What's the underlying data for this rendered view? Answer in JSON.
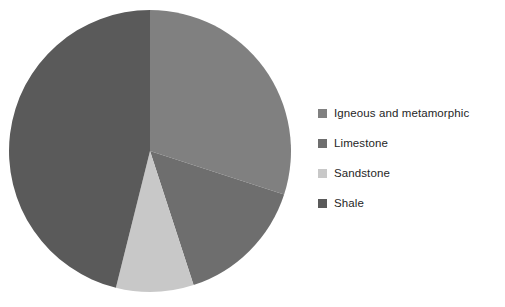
{
  "chart_data": {
    "type": "pie",
    "title": "",
    "categories": [
      "Igneous and metamorphic",
      "Limestone",
      "Sandstone",
      "Shale"
    ],
    "values": [
      30,
      15,
      9,
      46
    ],
    "unit": "percent",
    "colors": [
      "#808080",
      "#6e6e6e",
      "#c8c8c8",
      "#5a5a5a"
    ],
    "start_angle_deg": 0,
    "direction": "clockwise",
    "legend_position": "right",
    "grid": false,
    "labels_on_slices": false,
    "slice_angles_deg": [
      {
        "name": "Igneous and metamorphic",
        "start": 0,
        "end": 108
      },
      {
        "name": "Limestone",
        "start": 108,
        "end": 162
      },
      {
        "name": "Sandstone",
        "start": 162,
        "end": 194
      },
      {
        "name": "Shale",
        "start": 194,
        "end": 360
      }
    ]
  },
  "legend": {
    "items": [
      {
        "label": "Igneous and metamorphic",
        "color": "#808080",
        "swatch_icon": "square-swatch-icon"
      },
      {
        "label": "Limestone",
        "color": "#6e6e6e",
        "swatch_icon": "square-swatch-icon"
      },
      {
        "label": "Sandstone",
        "color": "#c8c8c8",
        "swatch_icon": "square-swatch-icon"
      },
      {
        "label": "Shale",
        "color": "#5a5a5a",
        "swatch_icon": "square-swatch-icon"
      }
    ]
  },
  "pie_geometry": {
    "center_x": 150,
    "center_y": 151,
    "radius": 141
  },
  "canvas": {
    "width": 505,
    "height": 307,
    "background": "#ffffff"
  }
}
